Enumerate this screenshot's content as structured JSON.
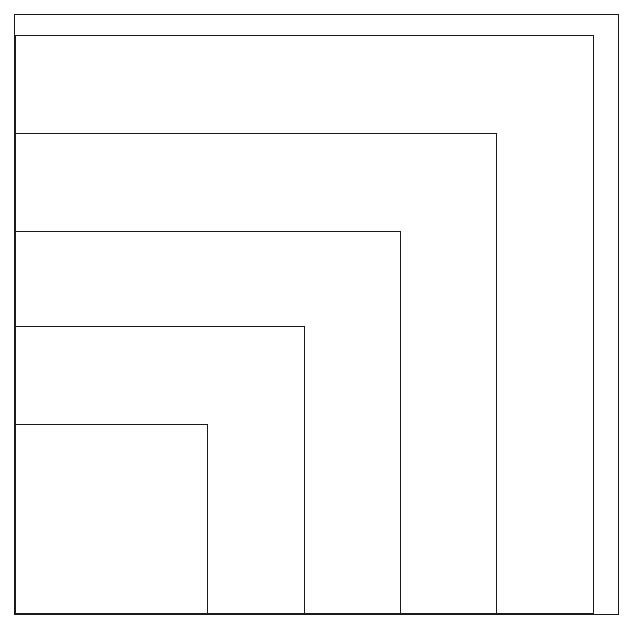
{
  "figure": {
    "background_color": "#ffffff",
    "stroke_color": "#1a1a1a",
    "canvas": {
      "width": 629,
      "height": 626
    }
  },
  "chart_data": {
    "type": "diagram",
    "title": "",
    "xlabel": "",
    "ylabel": "",
    "grid": false,
    "legend": null,
    "xlim": [
      0,
      629
    ],
    "ylim": [
      0,
      626
    ],
    "shapes": [
      {
        "name": "outer-frame",
        "kind": "rectangle",
        "x": 14.5,
        "y": 14.5,
        "width": 604,
        "height": 600,
        "stroke_width": 1.4
      },
      {
        "name": "spiral-rect-1",
        "kind": "rectangle",
        "x": 15.5,
        "y": 35.5,
        "width": 578,
        "height": 578,
        "stroke_width": 1.7
      },
      {
        "name": "spiral-rect-2",
        "kind": "rectangle",
        "x": 15.5,
        "y": 133.5,
        "width": 481,
        "height": 480,
        "stroke_width": 1.7
      },
      {
        "name": "spiral-rect-3",
        "kind": "rectangle",
        "x": 15.5,
        "y": 231.5,
        "width": 385,
        "height": 382,
        "stroke_width": 1.7
      },
      {
        "name": "spiral-rect-4",
        "kind": "rectangle",
        "x": 15.5,
        "y": 326.5,
        "width": 289,
        "height": 287,
        "stroke_width": 1.7
      },
      {
        "name": "spiral-rect-5",
        "kind": "rectangle",
        "x": 15.5,
        "y": 424.5,
        "width": 192,
        "height": 189,
        "stroke_width": 1.7
      }
    ],
    "vertical_edges": [
      15.5,
      207.5,
      304.5,
      400.5,
      496.5,
      593.5
    ],
    "horizontal_edges": [
      35.5,
      133.5,
      231.5,
      326.5,
      424.5,
      613.5
    ]
  }
}
